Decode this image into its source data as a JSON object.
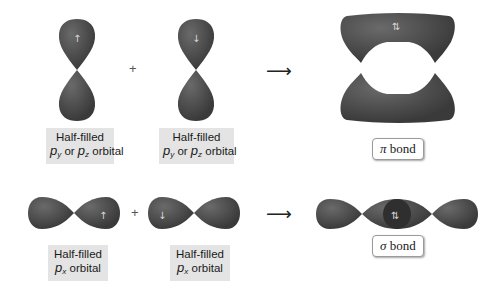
{
  "colors": {
    "orbital": "#4a4a4a",
    "label_bg": "#e4e4e4",
    "background": "#ffffff"
  },
  "pi_row": {
    "left_orbital": {
      "type": "p_y/p_z",
      "spin": "↑",
      "label_line1": "Half-filled",
      "label_p1": "p",
      "label_sub1": "y",
      "label_or": " or ",
      "label_p2": "p",
      "label_sub2": "z",
      "label_tail": " orbital"
    },
    "operator": "+",
    "right_orbital": {
      "type": "p_y/p_z",
      "spin": "↓",
      "label_line1": "Half-filled",
      "label_p1": "p",
      "label_sub1": "y",
      "label_or": " or ",
      "label_p2": "p",
      "label_sub2": "z",
      "label_tail": " orbital"
    },
    "arrow": "⟶",
    "result": {
      "spin": "⇅",
      "symbol": "π",
      "label": " bond"
    }
  },
  "sigma_row": {
    "left_orbital": {
      "type": "p_x",
      "spin": "↑",
      "label_line1": "Half-filled",
      "label_p": "p",
      "label_sub": "x",
      "label_tail": " orbital"
    },
    "operator": "+",
    "right_orbital": {
      "type": "p_x",
      "spin": "↓",
      "label_line1": "Half-filled",
      "label_p": "p",
      "label_sub": "x",
      "label_tail": " orbital"
    },
    "arrow": "⟶",
    "result": {
      "spin": "⇅",
      "symbol": "σ",
      "label": " bond"
    }
  }
}
